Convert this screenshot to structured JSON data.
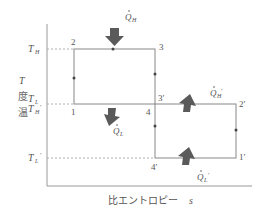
{
  "diagram": {
    "type": "T-s diagram (two-stage refrigeration / heat pump cycle)",
    "axes": {
      "y_label": "温度 T",
      "y_label_chars": [
        "温",
        "度",
        "T"
      ],
      "x_label": "比エントロピー",
      "x_symbol": "s"
    },
    "temperature_levels": {
      "TH": {
        "label_main": "T",
        "label_sub": "H",
        "label_prime": ""
      },
      "TL": {
        "label_main": "T",
        "label_sub": "L",
        "label_prime": ""
      },
      "THp": {
        "label_main": "T",
        "label_sub": "H",
        "label_prime": "′"
      },
      "TLp": {
        "label_main": "T",
        "label_sub": "L",
        "label_prime": "′"
      }
    },
    "states": {
      "p1": "1",
      "p2": "2",
      "p3": "3",
      "p3p": "3′",
      "p4": "4",
      "p1p": "1′",
      "p2p": "2′",
      "p4p": "4′"
    },
    "heat_flows": {
      "QH": {
        "label": "Q",
        "sub": "H",
        "prime": "",
        "direction": "in"
      },
      "QL": {
        "label": "Q",
        "sub": "L",
        "prime": "",
        "direction": "out"
      },
      "QHp": {
        "label": "Q",
        "sub": "H",
        "prime": "′",
        "direction": "out"
      },
      "QLp": {
        "label": "Q",
        "sub": "L",
        "prime": "′",
        "direction": "in"
      }
    },
    "colors": {
      "line": "#888888",
      "dashed": "#b0b0b0",
      "arrow_fill": "#5a5a5a",
      "text": "#555555"
    }
  }
}
